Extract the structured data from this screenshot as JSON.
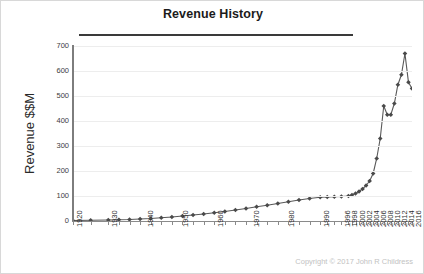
{
  "chart_data": {
    "type": "line",
    "title": "Revenue History",
    "xlabel": "",
    "ylabel": "Revenue $$M",
    "ylim": [
      0,
      700
    ],
    "ytick_values": [
      0,
      100,
      200,
      300,
      400,
      500,
      600,
      700
    ],
    "ytick_labels": [
      "0",
      "100",
      "200",
      "300",
      "400",
      "500",
      "600",
      "700"
    ],
    "grid": true,
    "legend": false,
    "marker": "diamond",
    "line_color": "#595959",
    "marker_color": "#4a4a4a",
    "xtick_labels": [
      "1920",
      "1930",
      "1940",
      "1950",
      "1960",
      "1970",
      "1980",
      "1990",
      "1996",
      "1998",
      "2000",
      "2002",
      "2004",
      "2006",
      "2008",
      "2010",
      "2012",
      "2014",
      "2016"
    ],
    "x": [
      1920,
      1925,
      1930,
      1933,
      1936,
      1939,
      1942,
      1945,
      1948,
      1951,
      1954,
      1957,
      1960,
      1963,
      1966,
      1969,
      1972,
      1975,
      1978,
      1981,
      1984,
      1987,
      1990,
      1992,
      1994,
      1996,
      1998,
      1999,
      2000,
      2001,
      2002,
      2003,
      2004,
      2005,
      2006,
      2007,
      2008,
      2009,
      2010,
      2011,
      2012,
      2013,
      2014,
      2015,
      2016
    ],
    "values": [
      2,
      3,
      4,
      5,
      6,
      8,
      10,
      13,
      16,
      20,
      24,
      28,
      33,
      38,
      44,
      50,
      57,
      63,
      70,
      77,
      84,
      90,
      95,
      96,
      97,
      98,
      100,
      104,
      110,
      118,
      128,
      142,
      160,
      190,
      250,
      330,
      460,
      425,
      425,
      470,
      545,
      585,
      670,
      555,
      530
    ],
    "annotations": [
      "Copyright © 2017 John R Childress"
    ]
  },
  "footer": {
    "copyright": "Copyright © 2017 John R Childress"
  }
}
